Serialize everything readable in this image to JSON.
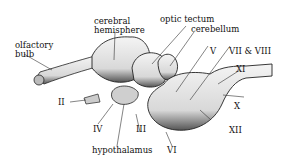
{
  "diagram": {
    "labels": {
      "olfactory_bulb_1": "olfactory",
      "olfactory_bulb_2": "bulb",
      "cerebral_hemisphere_1": "cerebral",
      "cerebral_hemisphere_2": "hemisphere",
      "optic_tectum": "optic tectum",
      "cerebellum": "cerebellum",
      "nerve_V": "V",
      "nerve_VII_VIII": "VII & VIII",
      "nerve_XI": "XI",
      "nerve_X": "X",
      "nerve_XII": "XII",
      "nerve_II": "II",
      "nerve_IV": "IV",
      "nerve_III": "III",
      "hypothalamus": "hypothalamus",
      "nerve_VI": "VI"
    }
  }
}
